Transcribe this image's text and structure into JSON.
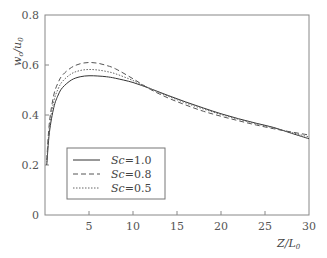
{
  "chart_data": {
    "type": "line",
    "title": "",
    "xlabel": "Z/L0",
    "ylabel": "wc/u0",
    "xlim": [
      0,
      30
    ],
    "ylim": [
      0,
      0.8
    ],
    "xticks": [
      "5",
      "10",
      "15",
      "20",
      "25",
      "30"
    ],
    "yticks": [
      "0",
      "0.2",
      "0.4",
      "0.6",
      "0.8"
    ],
    "grid": false,
    "legend_position": "lower-left inside",
    "x": [
      0.2,
      0.5,
      1,
      1.5,
      2,
      3,
      4,
      5,
      6,
      7,
      8,
      10,
      12,
      14,
      16,
      18,
      20,
      22,
      24,
      26,
      28,
      30
    ],
    "series": [
      {
        "name": "Sc=1.0",
        "style": "solid",
        "values": [
          0.2,
          0.33,
          0.43,
          0.48,
          0.51,
          0.54,
          0.553,
          0.557,
          0.556,
          0.553,
          0.547,
          0.53,
          0.505,
          0.478,
          0.452,
          0.428,
          0.405,
          0.385,
          0.367,
          0.35,
          0.327,
          0.305
        ]
      },
      {
        "name": "Sc=0.8",
        "style": "dashed",
        "values": [
          0.22,
          0.37,
          0.48,
          0.53,
          0.56,
          0.59,
          0.605,
          0.61,
          0.607,
          0.598,
          0.585,
          0.545,
          0.502,
          0.468,
          0.44,
          0.415,
          0.395,
          0.377,
          0.36,
          0.345,
          0.332,
          0.32
        ]
      },
      {
        "name": "Sc=0.5",
        "style": "dotted",
        "values": [
          0.21,
          0.35,
          0.455,
          0.505,
          0.535,
          0.565,
          0.578,
          0.582,
          0.58,
          0.574,
          0.565,
          0.538,
          0.505,
          0.475,
          0.448,
          0.424,
          0.402,
          0.383,
          0.365,
          0.348,
          0.33,
          0.312
        ]
      }
    ]
  },
  "axes": {
    "xlabel_main": "Z",
    "xlabel_sub": "0",
    "xlabel_den": "L",
    "ylabel_main": "w",
    "ylabel_sub_c": "c",
    "ylabel_den": "u",
    "ylabel_sub_0": "0"
  },
  "legend": [
    {
      "label": "Sc",
      "value": "=1.0"
    },
    {
      "label": "Sc",
      "value": "=0.8"
    },
    {
      "label": "Sc",
      "value": "=0.5"
    }
  ]
}
